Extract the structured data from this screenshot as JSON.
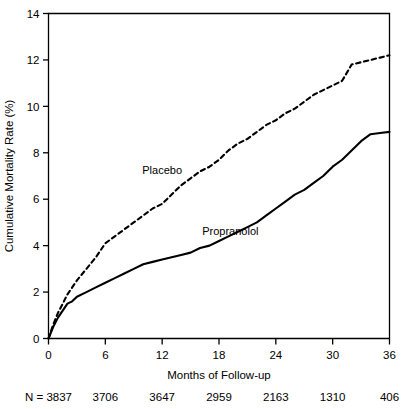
{
  "chart_data": {
    "type": "line",
    "title": "",
    "xlabel": "Months of Follow-up",
    "ylabel": "Cumulative Mortality Rate (%)",
    "xlim": [
      0,
      36
    ],
    "ylim": [
      0,
      14
    ],
    "xticks": [
      0,
      6,
      12,
      18,
      24,
      30,
      36
    ],
    "xtick_labels": [
      "0",
      "6",
      "12",
      "18",
      "24",
      "30",
      "36"
    ],
    "yticks": [
      0,
      2,
      4,
      6,
      8,
      10,
      12,
      14
    ],
    "ytick_labels": [
      "0",
      "2",
      "4",
      "6",
      "8",
      "10",
      "12",
      "14"
    ],
    "grid": false,
    "legend_position": "inline-annotations",
    "series": [
      {
        "name": "Placebo",
        "style": "dashed",
        "color": "#000000",
        "label_x": 12.0,
        "label_y": 7.1,
        "x": [
          0,
          0.5,
          1,
          1.5,
          2,
          2.5,
          3,
          4,
          5,
          6,
          7,
          8,
          9,
          10,
          11,
          12,
          13,
          14,
          15,
          16,
          17,
          18,
          19,
          20,
          21,
          22,
          23,
          24,
          25,
          26,
          27,
          28,
          29,
          30,
          31,
          32,
          33,
          34,
          35,
          36
        ],
        "y": [
          0,
          0.6,
          1.1,
          1.5,
          1.9,
          2.2,
          2.5,
          3.0,
          3.5,
          4.1,
          4.4,
          4.7,
          5.0,
          5.3,
          5.6,
          5.8,
          6.2,
          6.6,
          6.9,
          7.2,
          7.4,
          7.7,
          8.1,
          8.4,
          8.6,
          8.9,
          9.2,
          9.4,
          9.7,
          9.9,
          10.2,
          10.5,
          10.7,
          10.9,
          11.1,
          11.8,
          11.9,
          12.0,
          12.1,
          12.2
        ]
      },
      {
        "name": "Propranolol",
        "style": "solid",
        "color": "#000000",
        "label_x": 19.2,
        "label_y": 4.45,
        "x": [
          0,
          0.5,
          1,
          1.5,
          2,
          2.5,
          3,
          4,
          5,
          6,
          7,
          8,
          9,
          10,
          11,
          12,
          13,
          14,
          15,
          16,
          17,
          18,
          19,
          20,
          21,
          22,
          23,
          24,
          25,
          26,
          27,
          28,
          29,
          30,
          31,
          32,
          33,
          34,
          35,
          36
        ],
        "y": [
          0,
          0.5,
          0.9,
          1.2,
          1.5,
          1.6,
          1.8,
          2.0,
          2.2,
          2.4,
          2.6,
          2.8,
          3.0,
          3.2,
          3.3,
          3.4,
          3.5,
          3.6,
          3.7,
          3.9,
          4.0,
          4.2,
          4.4,
          4.6,
          4.8,
          5.0,
          5.3,
          5.6,
          5.9,
          6.2,
          6.4,
          6.7,
          7.0,
          7.4,
          7.7,
          8.1,
          8.5,
          8.8,
          8.85,
          8.9
        ]
      }
    ],
    "risk_table": {
      "prefix": "N = ",
      "values": [
        "3837",
        "3706",
        "3647",
        "2959",
        "2163",
        "1310",
        "406"
      ]
    }
  }
}
